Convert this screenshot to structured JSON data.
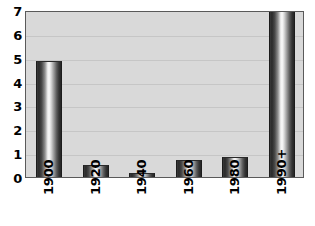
{
  "chart_data": {
    "type": "bar",
    "title": "",
    "subtitle": "",
    "xlabel": "",
    "ylabel": "",
    "categories": [
      "1900",
      "1920",
      "1940",
      "1960",
      "1980",
      "1990+"
    ],
    "values": [
      4.85,
      0.5,
      0.15,
      0.7,
      0.85,
      7.0
    ],
    "ylim": [
      0,
      7
    ],
    "ytick_labels": [
      "0",
      "1",
      "2",
      "3",
      "4",
      "5",
      "6",
      "7"
    ],
    "ytick_values": [
      0,
      1,
      2,
      3,
      4,
      5,
      6,
      7
    ],
    "grid": true,
    "legend": false,
    "legend_position": "none",
    "colors": {
      "plot_background": "#d9d9d9",
      "page_background": "#ffffff",
      "bar_dark": "#2a2a2a",
      "bar_highlight": "#fbfbfb",
      "gridline": "#c6c6c6",
      "axis_border": "#5a5a5a",
      "text": "#000000"
    }
  }
}
